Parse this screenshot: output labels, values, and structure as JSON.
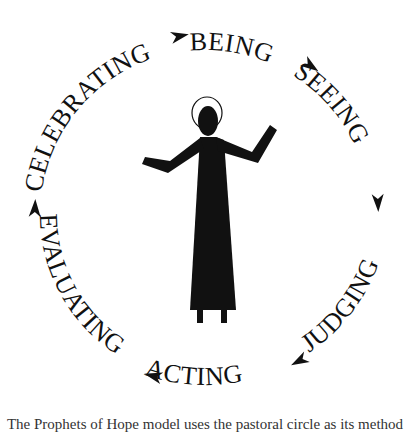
{
  "diagram": {
    "title": "Pastoral circle",
    "stages": [
      {
        "label": "BEING"
      },
      {
        "label": "SEEING"
      },
      {
        "label": "JUDGING"
      },
      {
        "label": "ACTING"
      },
      {
        "label": "EVALUATING"
      },
      {
        "label": "CELEBRATING"
      }
    ],
    "direction": "clockwise",
    "center_figure": "haloed-figure-with-raised-arms",
    "colors": {
      "ink": "#111111",
      "background": "#ffffff"
    }
  },
  "caption": {
    "text": "The Prophets of Hope model uses the pastoral circle as its method"
  }
}
